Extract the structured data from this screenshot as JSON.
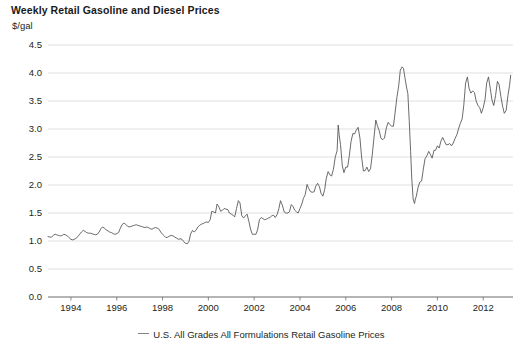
{
  "chart_data": {
    "type": "line",
    "title": "Weekly Retail Gasoline and Diesel Prices",
    "ylabel": "$/gal",
    "xlabel": "",
    "ylim": [
      0.0,
      4.5
    ],
    "xlim": [
      1993.0,
      2013.3
    ],
    "grid": true,
    "legend_position": "bottom-center",
    "ytick_labels": [
      "4.5",
      "4.0",
      "3.5",
      "3.0",
      "2.5",
      "2.0",
      "1.5",
      "1.0",
      "0.5",
      "0.0"
    ],
    "ytick_values": [
      4.5,
      4.0,
      3.5,
      3.0,
      2.5,
      2.0,
      1.5,
      1.0,
      0.5,
      0.0
    ],
    "xtick_labels": [
      "1994",
      "1996",
      "1998",
      "2000",
      "2002",
      "2004",
      "2006",
      "2008",
      "2010",
      "2012"
    ],
    "xtick_values": [
      1994,
      1996,
      1998,
      2000,
      2002,
      2004,
      2006,
      2008,
      2010,
      2012
    ],
    "series": [
      {
        "name": "U.S. All Grades All Formulations Retail Gasoline Prices",
        "color": "#4f5052",
        "x": [
          1993.0,
          1993.08,
          1993.15,
          1993.23,
          1993.31,
          1993.38,
          1993.46,
          1993.54,
          1993.62,
          1993.69,
          1993.77,
          1993.85,
          1993.92,
          1994.0,
          1994.08,
          1994.15,
          1994.23,
          1994.31,
          1994.38,
          1994.46,
          1994.54,
          1994.62,
          1994.69,
          1994.77,
          1994.85,
          1994.92,
          1995.0,
          1995.08,
          1995.15,
          1995.23,
          1995.31,
          1995.38,
          1995.46,
          1995.54,
          1995.62,
          1995.69,
          1995.77,
          1995.85,
          1995.92,
          1996.0,
          1996.08,
          1996.15,
          1996.23,
          1996.31,
          1996.38,
          1996.46,
          1996.54,
          1996.62,
          1996.69,
          1996.77,
          1996.85,
          1996.92,
          1997.0,
          1997.08,
          1997.15,
          1997.23,
          1997.31,
          1997.38,
          1997.46,
          1997.54,
          1997.62,
          1997.69,
          1997.77,
          1997.85,
          1997.92,
          1998.0,
          1998.08,
          1998.15,
          1998.23,
          1998.31,
          1998.38,
          1998.46,
          1998.54,
          1998.62,
          1998.69,
          1998.77,
          1998.85,
          1998.92,
          1999.0,
          1999.08,
          1999.15,
          1999.23,
          1999.31,
          1999.38,
          1999.46,
          1999.54,
          1999.62,
          1999.69,
          1999.77,
          1999.85,
          1999.92,
          2000.0,
          2000.08,
          2000.15,
          2000.23,
          2000.31,
          2000.38,
          2000.46,
          2000.54,
          2000.62,
          2000.69,
          2000.77,
          2000.85,
          2000.92,
          2001.0,
          2001.08,
          2001.15,
          2001.23,
          2001.31,
          2001.38,
          2001.46,
          2001.54,
          2001.62,
          2001.69,
          2001.77,
          2001.85,
          2001.92,
          2002.0,
          2002.08,
          2002.15,
          2002.23,
          2002.31,
          2002.38,
          2002.46,
          2002.54,
          2002.62,
          2002.69,
          2002.77,
          2002.85,
          2002.92,
          2003.0,
          2003.08,
          2003.15,
          2003.23,
          2003.31,
          2003.38,
          2003.46,
          2003.54,
          2003.62,
          2003.69,
          2003.77,
          2003.85,
          2003.92,
          2004.0,
          2004.08,
          2004.15,
          2004.23,
          2004.31,
          2004.38,
          2004.46,
          2004.54,
          2004.62,
          2004.69,
          2004.77,
          2004.85,
          2004.92,
          2005.0,
          2005.08,
          2005.15,
          2005.23,
          2005.31,
          2005.38,
          2005.46,
          2005.54,
          2005.62,
          2005.67,
          2005.71,
          2005.77,
          2005.85,
          2005.92,
          2006.0,
          2006.08,
          2006.15,
          2006.23,
          2006.31,
          2006.38,
          2006.46,
          2006.54,
          2006.62,
          2006.69,
          2006.77,
          2006.85,
          2006.92,
          2007.0,
          2007.08,
          2007.15,
          2007.23,
          2007.31,
          2007.38,
          2007.46,
          2007.54,
          2007.62,
          2007.69,
          2007.77,
          2007.85,
          2007.92,
          2008.0,
          2008.08,
          2008.15,
          2008.23,
          2008.31,
          2008.38,
          2008.46,
          2008.52,
          2008.58,
          2008.65,
          2008.71,
          2008.77,
          2008.83,
          2008.88,
          2008.94,
          2009.0,
          2009.04,
          2009.08,
          2009.15,
          2009.23,
          2009.31,
          2009.38,
          2009.46,
          2009.54,
          2009.62,
          2009.69,
          2009.77,
          2009.85,
          2009.92,
          2010.0,
          2010.08,
          2010.15,
          2010.23,
          2010.31,
          2010.38,
          2010.46,
          2010.54,
          2010.62,
          2010.69,
          2010.77,
          2010.85,
          2010.92,
          2011.0,
          2011.08,
          2011.15,
          2011.23,
          2011.31,
          2011.38,
          2011.46,
          2011.54,
          2011.62,
          2011.69,
          2011.77,
          2011.85,
          2011.92,
          2012.0,
          2012.08,
          2012.15,
          2012.23,
          2012.31,
          2012.38,
          2012.46,
          2012.54,
          2012.62,
          2012.69,
          2012.77,
          2012.85,
          2012.92,
          2013.0,
          2013.08,
          2013.15,
          2013.2
        ],
        "values": [
          1.08,
          1.07,
          1.07,
          1.1,
          1.12,
          1.11,
          1.1,
          1.09,
          1.1,
          1.12,
          1.11,
          1.09,
          1.06,
          1.03,
          1.02,
          1.03,
          1.05,
          1.08,
          1.12,
          1.16,
          1.19,
          1.17,
          1.15,
          1.14,
          1.14,
          1.13,
          1.12,
          1.11,
          1.12,
          1.16,
          1.22,
          1.25,
          1.23,
          1.2,
          1.18,
          1.16,
          1.15,
          1.13,
          1.12,
          1.13,
          1.15,
          1.22,
          1.29,
          1.32,
          1.3,
          1.27,
          1.25,
          1.26,
          1.27,
          1.28,
          1.29,
          1.28,
          1.27,
          1.26,
          1.25,
          1.24,
          1.25,
          1.24,
          1.22,
          1.21,
          1.23,
          1.24,
          1.23,
          1.21,
          1.16,
          1.12,
          1.09,
          1.06,
          1.07,
          1.09,
          1.1,
          1.09,
          1.07,
          1.05,
          1.03,
          1.04,
          1.03,
          0.99,
          0.96,
          0.95,
          0.99,
          1.13,
          1.19,
          1.16,
          1.19,
          1.25,
          1.28,
          1.3,
          1.31,
          1.33,
          1.34,
          1.33,
          1.38,
          1.53,
          1.52,
          1.5,
          1.66,
          1.61,
          1.53,
          1.55,
          1.58,
          1.57,
          1.56,
          1.5,
          1.48,
          1.46,
          1.43,
          1.58,
          1.72,
          1.68,
          1.45,
          1.41,
          1.45,
          1.48,
          1.35,
          1.2,
          1.12,
          1.12,
          1.12,
          1.2,
          1.38,
          1.42,
          1.4,
          1.38,
          1.39,
          1.41,
          1.42,
          1.45,
          1.46,
          1.42,
          1.47,
          1.58,
          1.72,
          1.64,
          1.52,
          1.5,
          1.5,
          1.52,
          1.65,
          1.62,
          1.55,
          1.52,
          1.5,
          1.58,
          1.66,
          1.76,
          1.83,
          2.01,
          1.94,
          1.88,
          1.87,
          1.88,
          1.98,
          2.03,
          1.97,
          1.85,
          1.8,
          1.92,
          2.12,
          2.24,
          2.18,
          2.16,
          2.28,
          2.5,
          2.61,
          3.07,
          2.9,
          2.72,
          2.34,
          2.22,
          2.32,
          2.32,
          2.51,
          2.78,
          2.92,
          2.91,
          2.98,
          3.03,
          2.83,
          2.5,
          2.25,
          2.26,
          2.32,
          2.24,
          2.29,
          2.52,
          2.84,
          3.16,
          3.06,
          2.97,
          2.83,
          2.81,
          2.84,
          3.02,
          3.12,
          3.08,
          3.05,
          3.05,
          3.28,
          3.56,
          3.77,
          4.05,
          4.11,
          4.08,
          3.92,
          3.75,
          3.63,
          3.15,
          2.6,
          2.12,
          1.75,
          1.67,
          1.75,
          1.8,
          1.95,
          2.05,
          2.07,
          2.27,
          2.47,
          2.52,
          2.6,
          2.55,
          2.48,
          2.62,
          2.62,
          2.7,
          2.66,
          2.78,
          2.85,
          2.78,
          2.72,
          2.72,
          2.74,
          2.7,
          2.75,
          2.83,
          2.9,
          3.0,
          3.1,
          3.18,
          3.42,
          3.82,
          3.93,
          3.73,
          3.64,
          3.68,
          3.65,
          3.5,
          3.42,
          3.38,
          3.28,
          3.38,
          3.53,
          3.82,
          3.93,
          3.72,
          3.52,
          3.42,
          3.6,
          3.85,
          3.8,
          3.58,
          3.4,
          3.28,
          3.33,
          3.6,
          3.78,
          3.96
        ]
      }
    ]
  },
  "legend": {
    "entries": [
      {
        "label": "U.S. All Grades All Formulations Retail Gasoline Prices"
      }
    ]
  }
}
